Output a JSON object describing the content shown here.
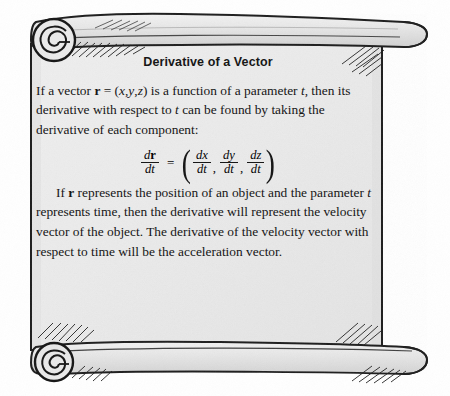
{
  "figure": {
    "kind": "scroll-illustration",
    "name": "parchment-scroll",
    "paper_color": "#ececec",
    "paper_color_shade": "#dcdcdc",
    "ink_color": "#141414",
    "background_color": "#ffffff"
  },
  "document": {
    "title": "Derivative of a Vector",
    "paragraph_1": {
      "seg_1": "If a vector ",
      "vector_symbol": "r",
      "seg_2": " = (",
      "comp_x": "x",
      "comma_1": ",",
      "comp_y": "y",
      "comma_2": ",",
      "comp_z": "z",
      "seg_3": ") is a function of a parameter ",
      "param_symbol": "t",
      "seg_4": ", then its derivative with respect to ",
      "param_symbol_2": "t",
      "seg_5": " can be found by taking the derivative of each component:"
    },
    "formula": {
      "lhs": {
        "numerator_d": "d",
        "numerator_var": "r",
        "denominator": "dt"
      },
      "equals": "=",
      "open_paren": "(",
      "close_paren": ")",
      "terms": [
        {
          "numerator": "dx",
          "denominator": "dt",
          "separator": ","
        },
        {
          "numerator": "dy",
          "denominator": "dt",
          "separator": ","
        },
        {
          "numerator": "dz",
          "denominator": "dt",
          "separator": ""
        }
      ]
    },
    "paragraph_2": {
      "seg_1": "If ",
      "vector_symbol": "r",
      "seg_2": " represents the position of an object and the parameter ",
      "param_symbol": "t",
      "seg_3": " represents time, then the derivative will represent the velocity vector of the object. The derivative of the velocity vector with respect to time will be the acceleration vector."
    }
  }
}
